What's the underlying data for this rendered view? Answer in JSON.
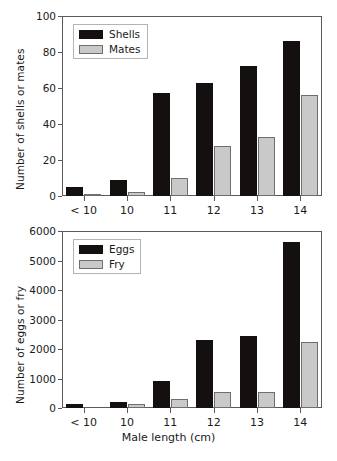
{
  "figure": {
    "width": 337,
    "height": 461,
    "background": "#ffffff",
    "xlabel": "Male length (cm)",
    "series_colors": {
      "dark": "#151010",
      "light": "#c9c9c9",
      "light_border": "#6e6e6e",
      "axis": "#5a5a5a"
    }
  },
  "chart_data": [
    {
      "type": "bar",
      "title": "",
      "panel": "top",
      "xlabel": "",
      "ylabel": "Number of shells or mates",
      "categories": [
        "< 10",
        "10",
        "11",
        "12",
        "13",
        "14"
      ],
      "ylim": [
        0,
        100
      ],
      "yticks": [
        0,
        20,
        40,
        60,
        80,
        100
      ],
      "ytick_labels": [
        "0",
        "20",
        "40",
        "60",
        "80",
        "100"
      ],
      "grid": false,
      "legend_position": "upper left",
      "series": [
        {
          "name": "Shells",
          "color": "#151010",
          "values": [
            5,
            9,
            57,
            63,
            72,
            86
          ]
        },
        {
          "name": "Mates",
          "color": "#c9c9c9",
          "values": [
            1,
            2,
            10,
            28,
            33,
            56
          ]
        }
      ]
    },
    {
      "type": "bar",
      "title": "",
      "panel": "bottom",
      "xlabel": "Male length (cm)",
      "ylabel": "Number of eggs or fry",
      "categories": [
        "< 10",
        "10",
        "11",
        "12",
        "13",
        "14"
      ],
      "ylim": [
        0,
        6000
      ],
      "yticks": [
        0,
        1000,
        2000,
        3000,
        4000,
        5000,
        6000
      ],
      "ytick_labels": [
        "0",
        "1000",
        "2000",
        "3000",
        "4000",
        "5000",
        "6000"
      ],
      "grid": false,
      "legend_position": "upper left",
      "series": [
        {
          "name": "Eggs",
          "color": "#151010",
          "values": [
            150,
            220,
            900,
            2300,
            2450,
            5620
          ]
        },
        {
          "name": "Fry",
          "color": "#c9c9c9",
          "values": [
            0,
            130,
            300,
            550,
            550,
            2230
          ]
        }
      ]
    }
  ]
}
